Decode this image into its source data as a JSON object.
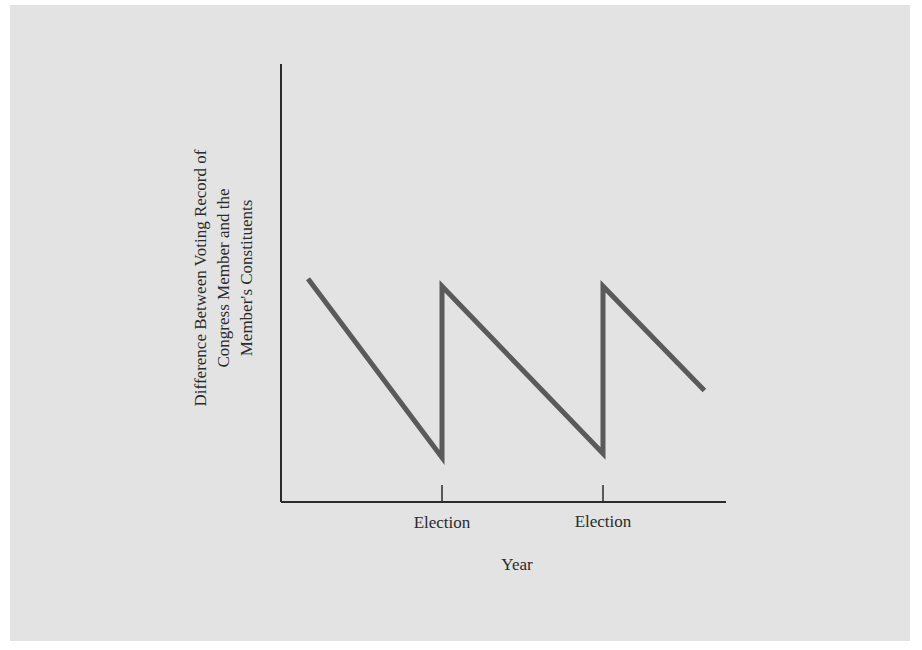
{
  "chart_data": {
    "type": "line",
    "title": "",
    "xlabel": "Year",
    "ylabel": "Difference Between Voting Record of Congress Member and the Member's Constituents",
    "ylabel_lines": [
      "Difference Between Voting Record of",
      "Congress Member and the",
      "Member's Constituents"
    ],
    "x_tick_labels": [
      "Election",
      "Election"
    ],
    "grid": false,
    "legend": null,
    "series": [
      {
        "name": "Difference",
        "color": "#5a5a5a",
        "points": [
          {
            "x": 0.0,
            "y": 0.6
          },
          {
            "x": 1.0,
            "y": 0.12
          },
          {
            "x": 1.0,
            "y": 0.58
          },
          {
            "x": 2.0,
            "y": 0.13
          },
          {
            "x": 2.0,
            "y": 0.58
          },
          {
            "x": 2.63,
            "y": 0.3
          }
        ]
      }
    ]
  },
  "colors": {
    "background": "#e3e3e3",
    "line": "#5a5a5a",
    "axis": "#2b2b2b"
  }
}
